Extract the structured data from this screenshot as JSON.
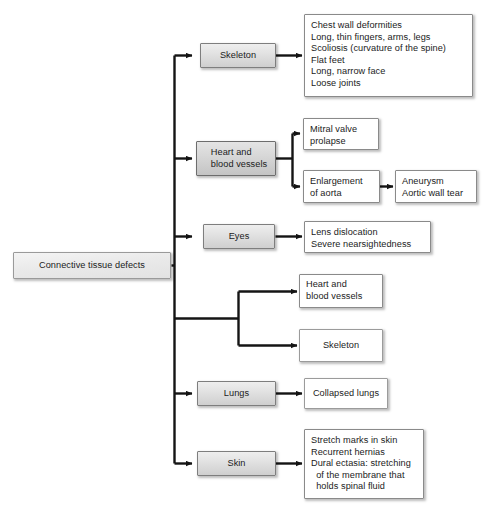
{
  "diagram": {
    "title": "Connective tissue defects",
    "root": {
      "label": "Connective tissue defects"
    },
    "branches": [
      {
        "category": "Skeleton",
        "detail": "Chest wall deformities\nLong, thin fingers, arms, legs\nScoliosis (curvature of the spine)\nFlat feet\nLong, narrow face\nLoose joints"
      },
      {
        "category": "Heart and\nblood vessels",
        "detail_top": "Mitral valve\nprolapse",
        "detail_bottom": "Enlargement\nof aorta",
        "detail_bottom_next": "Aneurysm\nAortic wall tear"
      },
      {
        "category": "Eyes",
        "detail": "Lens dislocation\nSevere nearsightedness"
      },
      {
        "category": "",
        "detail_top": "Heart and\nblood vessels",
        "detail_bottom": "Skeleton"
      },
      {
        "category": "Lungs",
        "detail": "Collapsed lungs"
      },
      {
        "category": "Skin",
        "detail": "Stretch marks in skin\nRecurrent hernias\nDural ectasia: stretching\n  of the membrane that\n  holds spinal fluid"
      }
    ]
  },
  "colors": {
    "background": "#ffffff",
    "line": "#141414",
    "text": "#1b1b1b",
    "node_border": "#8f8f8f",
    "category_fill": "#e3e3e3",
    "detail_fill": "#ffffff"
  }
}
